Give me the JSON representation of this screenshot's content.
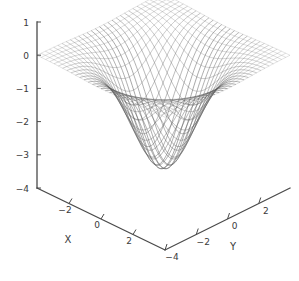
{
  "figure": {
    "kind": "3d-mesh-surface-plot",
    "background_color": "#ffffff",
    "mesh_color": "#595959",
    "axis_color": "#4a4a4a",
    "text_color": "#3a3a3a"
  },
  "axes": {
    "x": {
      "label": "X",
      "ticks": [
        -2,
        0,
        2
      ],
      "tick_labels": [
        "−2",
        "0",
        "2"
      ],
      "range": [
        -4,
        4
      ]
    },
    "y": {
      "label": "Y",
      "ticks": [
        -4,
        -2,
        0,
        2
      ],
      "tick_labels": [
        "−4",
        "−2",
        "0",
        "2"
      ],
      "range": [
        -4,
        4
      ]
    },
    "z": {
      "label": "",
      "ticks": [
        1,
        0,
        -1,
        -2,
        -3,
        -4
      ],
      "tick_labels": [
        "1",
        "0",
        "−1",
        "−2",
        "−3",
        "−4"
      ],
      "range": [
        -4,
        1
      ]
    }
  },
  "chart_data": {
    "type": "surface",
    "title": "",
    "xlabel": "X",
    "ylabel": "Y",
    "zlabel": "",
    "xlim": [
      -4,
      4
    ],
    "ylim": [
      -4,
      4
    ],
    "zlim": [
      -4,
      1
    ],
    "grid": false,
    "legend": "none",
    "projection": {
      "elevation_deg": 28,
      "azimuth_deg": 45,
      "style": "wireframe-mesh",
      "grid_lines_u": 31,
      "grid_lines_v": 31
    },
    "surface": {
      "description": "Inverted gaussian well, flat near zero at the edges, dipping to about -3.4 at the origin",
      "formula": "z = -3.4 * exp(-((x*x + y*y) / 4.2))",
      "z_min": -3.4,
      "z_max": 0.0,
      "z_at_origin": -3.4,
      "sample_x": [
        -4,
        -3,
        -2,
        -1,
        0,
        1,
        2,
        3,
        4
      ],
      "sample_y": [
        -4,
        -3,
        -2,
        -1,
        0,
        1,
        2,
        3,
        4
      ],
      "sample_z_rows": [
        [
          -0.0007,
          -0.0043,
          -0.0166,
          -0.0392,
          -0.0706,
          -0.0392,
          -0.0166,
          -0.0043,
          -0.0007
        ],
        [
          -0.0043,
          -0.0272,
          -0.1046,
          -0.2466,
          -0.4443,
          -0.2466,
          -0.1046,
          -0.0272,
          -0.0043
        ],
        [
          -0.0166,
          -0.1046,
          -0.4025,
          -0.9489,
          -1.7096,
          -0.9489,
          -0.4025,
          -0.1046,
          -0.0166
        ],
        [
          -0.0392,
          -0.2466,
          -0.9489,
          -2.2368,
          -4.0299,
          -2.2368,
          -0.9489,
          -0.2466,
          -0.0392
        ],
        [
          -0.0706,
          -0.4443,
          -1.7096,
          -4.0299,
          -3.4,
          -4.0299,
          -1.7096,
          -0.4443,
          -0.0706
        ],
        [
          -0.0392,
          -0.2466,
          -0.9489,
          -2.2368,
          -4.0299,
          -2.2368,
          -0.9489,
          -0.2466,
          -0.0392
        ],
        [
          -0.0166,
          -0.1046,
          -0.4025,
          -0.9489,
          -1.7096,
          -0.9489,
          -0.4025,
          -0.1046,
          -0.0166
        ],
        [
          -0.0043,
          -0.0272,
          -0.1046,
          -0.2466,
          -0.4443,
          -0.2466,
          -0.1046,
          -0.0272,
          -0.0043
        ],
        [
          -0.0007,
          -0.0043,
          -0.0166,
          -0.0392,
          -0.0706,
          -0.0392,
          -0.0166,
          -0.0043,
          -0.0007
        ]
      ]
    }
  }
}
